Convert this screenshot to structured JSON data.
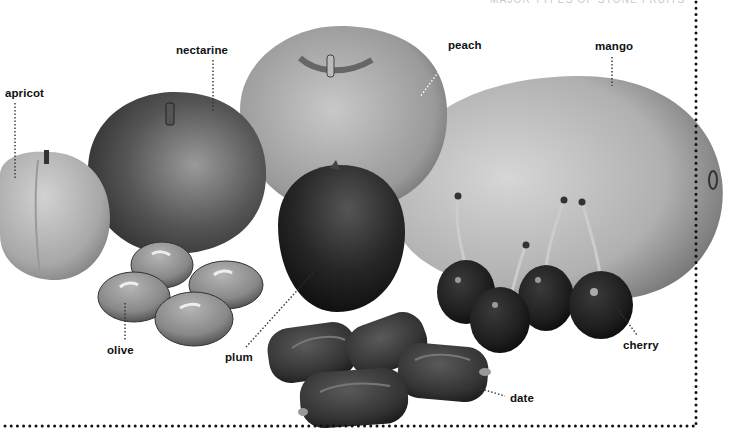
{
  "diagram": {
    "title": "MAJOR TYPES OF STONE FRUITS",
    "style": "grayscale illustration",
    "frame_color": "#111111",
    "labels": [
      {
        "id": "apricot",
        "text": "apricot"
      },
      {
        "id": "nectarine",
        "text": "nectarine"
      },
      {
        "id": "peach",
        "text": "peach"
      },
      {
        "id": "mango",
        "text": "mango"
      },
      {
        "id": "olive",
        "text": "olive"
      },
      {
        "id": "plum",
        "text": "plum"
      },
      {
        "id": "cherry",
        "text": "cherry"
      },
      {
        "id": "date",
        "text": "date"
      }
    ]
  }
}
